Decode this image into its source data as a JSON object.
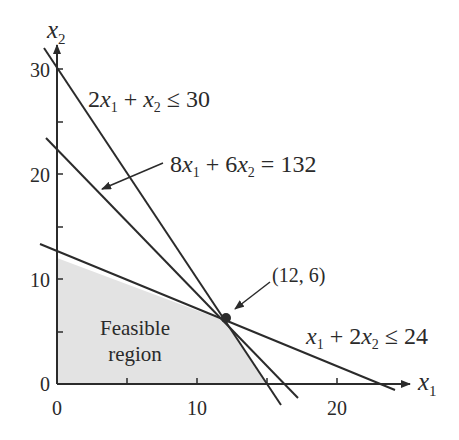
{
  "figure": {
    "type": "linear-programming-feasible-region",
    "colors": {
      "line": "#2b2b2b",
      "region": "#e3e3e3",
      "text": "#2a2a2a",
      "background": "#ffffff"
    },
    "axes": {
      "x_label": "x",
      "x_sub": "1",
      "y_label": "x",
      "y_sub": "2",
      "x_ticks": [
        "0",
        "10",
        "20"
      ],
      "y_ticks": [
        "0",
        "10",
        "20",
        "30"
      ],
      "xlim": [
        0,
        25
      ],
      "ylim": [
        0,
        32
      ]
    },
    "constraints": [
      {
        "id": "c1",
        "a": 2,
        "b": 1,
        "rhs": 30,
        "op": "≤",
        "parts": [
          "2",
          "x",
          "1",
          " + ",
          "x",
          "2",
          " ≤ 30"
        ]
      },
      {
        "id": "c2",
        "a": 1,
        "b": 2,
        "rhs": 24,
        "op": "≤",
        "parts": [
          "x",
          "1",
          " + 2",
          "x",
          "2",
          " ≤ 24"
        ]
      }
    ],
    "objective_line": {
      "a": 8,
      "b": 6,
      "rhs": 132,
      "op": "=",
      "parts": [
        "8",
        "x",
        "1",
        " + 6",
        "x",
        "2",
        " = 132"
      ]
    },
    "optimum": {
      "label": "(12, 6)",
      "x": 12,
      "y": 6
    },
    "region_label": [
      "Feasible",
      "region"
    ],
    "feasible_vertices": [
      [
        0,
        0
      ],
      [
        15,
        0
      ],
      [
        12,
        6
      ],
      [
        0,
        12
      ]
    ]
  }
}
